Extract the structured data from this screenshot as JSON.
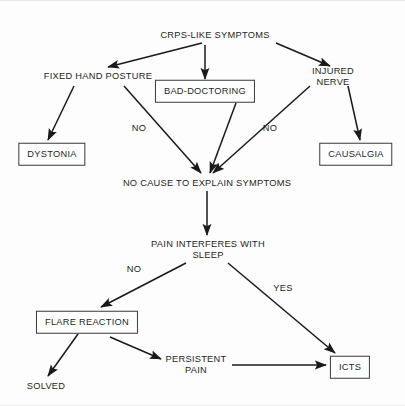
{
  "diagram": {
    "colors": {
      "background": "#fdfdfd",
      "text": "#231f20",
      "stroke": "#1a1a1a",
      "box_border": "#3a3a3a"
    },
    "nodes": [
      {
        "id": "crps",
        "label": "CRPS-LIKE SYMPTOMS",
        "boxed": false,
        "x": 215,
        "y": 34
      },
      {
        "id": "fixedhand",
        "label": "FIXED HAND POSTURE",
        "boxed": false,
        "x": 98,
        "y": 75
      },
      {
        "id": "baddoc",
        "label": "BAD-DOCTORING",
        "boxed": true,
        "x": 205,
        "y": 90
      },
      {
        "id": "injnerve",
        "label": "INJURED NERVE",
        "boxed": false,
        "x": 333,
        "y": 75
      },
      {
        "id": "dystonia",
        "label": "DYSTONIA",
        "boxed": true,
        "x": 52,
        "y": 153
      },
      {
        "id": "causalgia",
        "label": "CAUSALGIA",
        "boxed": true,
        "x": 356,
        "y": 153
      },
      {
        "id": "nocause",
        "label": "NO CAUSE TO EXPLAIN SYMPTOMS",
        "boxed": false,
        "x": 207,
        "y": 182
      },
      {
        "id": "painsleep",
        "label": "PAIN INTERFERES WITH\nSLEEP",
        "boxed": false,
        "x": 208,
        "y": 248
      },
      {
        "id": "flare",
        "label": "FLARE REACTION",
        "boxed": true,
        "x": 87,
        "y": 321
      },
      {
        "id": "persistent",
        "label": "PERSISTENT\nPAIN",
        "boxed": false,
        "x": 196,
        "y": 363
      },
      {
        "id": "icts",
        "label": "ICTS",
        "boxed": true,
        "x": 350,
        "y": 366
      },
      {
        "id": "solved",
        "label": "SOLVED",
        "boxed": false,
        "x": 46,
        "y": 385
      }
    ],
    "edge_labels": [
      {
        "id": "no-left",
        "label": "NO",
        "x": 139,
        "y": 127
      },
      {
        "id": "no-right",
        "label": "NO",
        "x": 270,
        "y": 127
      },
      {
        "id": "no-sleep",
        "label": "NO",
        "x": 134,
        "y": 268
      },
      {
        "id": "yes-sleep",
        "label": "YES",
        "x": 283,
        "y": 287
      }
    ],
    "edges": [
      {
        "id": "crps-to-fixedhand",
        "from": "crps",
        "to": "fixedhand",
        "x1": 202,
        "y1": 42,
        "x2": 108,
        "y2": 66
      },
      {
        "id": "crps-to-baddoc",
        "from": "crps",
        "to": "baddoc",
        "x1": 205,
        "y1": 44,
        "x2": 205,
        "y2": 78
      },
      {
        "id": "crps-to-injnerve",
        "from": "crps",
        "to": "injnerve",
        "x1": 276,
        "y1": 42,
        "x2": 330,
        "y2": 65
      },
      {
        "id": "fixedhand-to-dystonia",
        "from": "fixedhand",
        "to": "dystonia",
        "x1": 74,
        "y1": 85,
        "x2": 48,
        "y2": 139
      },
      {
        "id": "fixedhand-to-nocause",
        "from": "fixedhand",
        "to": "nocause",
        "x1": 124,
        "y1": 85,
        "x2": 201,
        "y2": 172
      },
      {
        "id": "baddoc-to-nocause",
        "from": "baddoc",
        "to": "nocause",
        "x1": 236,
        "y1": 102,
        "x2": 210,
        "y2": 172
      },
      {
        "id": "injnerve-to-nocause",
        "from": "injnerve",
        "to": "nocause",
        "x1": 310,
        "y1": 85,
        "x2": 213,
        "y2": 172
      },
      {
        "id": "injnerve-to-causalgia",
        "from": "injnerve",
        "to": "causalgia",
        "x1": 348,
        "y1": 85,
        "x2": 360,
        "y2": 139
      },
      {
        "id": "nocause-to-painsleep",
        "from": "nocause",
        "to": "painsleep",
        "x1": 207,
        "y1": 190,
        "x2": 207,
        "y2": 234
      },
      {
        "id": "painsleep-to-flare",
        "from": "painsleep",
        "to": "flare",
        "x1": 186,
        "y1": 262,
        "x2": 101,
        "y2": 306
      },
      {
        "id": "painsleep-to-icts",
        "from": "painsleep",
        "to": "icts",
        "x1": 228,
        "y1": 262,
        "x2": 335,
        "y2": 352
      },
      {
        "id": "flare-to-solved",
        "from": "flare",
        "to": "solved",
        "x1": 78,
        "y1": 333,
        "x2": 48,
        "y2": 375
      },
      {
        "id": "flare-to-persistent",
        "from": "flare",
        "to": "persistent",
        "x1": 110,
        "y1": 336,
        "x2": 161,
        "y2": 358
      },
      {
        "id": "persistent-to-icts",
        "from": "persistent",
        "to": "icts",
        "x1": 232,
        "y1": 364,
        "x2": 326,
        "y2": 364
      }
    ]
  }
}
